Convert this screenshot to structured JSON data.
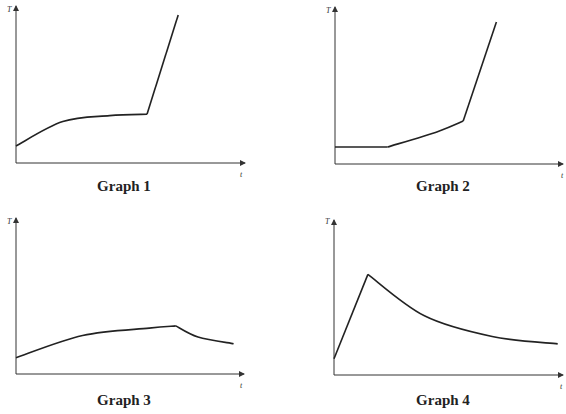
{
  "chart_data": [
    {
      "type": "line",
      "title": "Graph 1",
      "xlabel": "t",
      "ylabel": "T",
      "grid": false,
      "xlim": [
        0,
        10
      ],
      "ylim": [
        0,
        10
      ],
      "series": [
        {
          "name": "T vs t",
          "segments": [
            {
              "shape": "concave-rise",
              "points": [
                [
                  0,
                  1.15
                ],
                [
                  3,
                  2.8
                ],
                [
                  6,
                  3.2
                ],
                [
                  8.4,
                  3.3
                ]
              ]
            },
            {
              "shape": "linear",
              "points": [
                [
                  8.4,
                  3.3
                ],
                [
                  10.4,
                  10
                ]
              ]
            }
          ]
        }
      ]
    },
    {
      "type": "line",
      "title": "Graph 2",
      "xlabel": "t",
      "ylabel": "T",
      "grid": false,
      "xlim": [
        0,
        10
      ],
      "ylim": [
        0,
        10
      ],
      "series": [
        {
          "name": "T vs t",
          "segments": [
            {
              "shape": "flat",
              "points": [
                [
                  0,
                  1.15
                ],
                [
                  2.3,
                  1.15
                ]
              ]
            },
            {
              "shape": "concave-rise",
              "points": [
                [
                  2.3,
                  1.15
                ],
                [
                  4.5,
                  2.2
                ],
                [
                  5.6,
                  2.9
                ]
              ]
            },
            {
              "shape": "linear",
              "points": [
                [
                  5.6,
                  2.9
                ],
                [
                  7.05,
                  9.6
                ]
              ]
            }
          ]
        }
      ]
    },
    {
      "type": "line",
      "title": "Graph 3",
      "xlabel": "t",
      "ylabel": "T",
      "grid": false,
      "xlim": [
        0,
        10
      ],
      "ylim": [
        0,
        10
      ],
      "series": [
        {
          "name": "T vs t",
          "segments": [
            {
              "shape": "concave-rise",
              "points": [
                [
                  0,
                  1.1
                ],
                [
                  3,
                  2.6
                ],
                [
                  6,
                  3.1
                ],
                [
                  7.2,
                  3.25
                ]
              ]
            },
            {
              "shape": "decay",
              "points": [
                [
                  7.2,
                  3.25
                ],
                [
                  8.2,
                  2.5
                ],
                [
                  9.8,
                  2.05
                ]
              ]
            }
          ]
        }
      ]
    },
    {
      "type": "line",
      "title": "Graph 4",
      "xlabel": "t",
      "ylabel": "T",
      "grid": false,
      "xlim": [
        0,
        10
      ],
      "ylim": [
        0,
        10
      ],
      "series": [
        {
          "name": "T vs t",
          "segments": [
            {
              "shape": "linear",
              "points": [
                [
                  0,
                  1.1
                ],
                [
                  1.5,
                  6.8
                ]
              ]
            },
            {
              "shape": "decay",
              "points": [
                [
                  1.5,
                  6.8
                ],
                [
                  4.0,
                  4.0
                ],
                [
                  7.0,
                  2.6
                ],
                [
                  9.9,
                  2.1
                ]
              ]
            }
          ]
        }
      ]
    }
  ]
}
